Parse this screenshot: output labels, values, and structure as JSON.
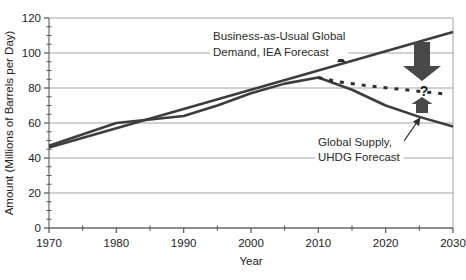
{
  "figure": {
    "background": "#ffffff"
  },
  "chart_data": {
    "type": "line",
    "title": "",
    "xlabel": "Year",
    "ylabel": "Amount (Millions of Barrels per Day)",
    "xlim": [
      1970,
      2030
    ],
    "ylim": [
      0,
      120
    ],
    "x_ticks": [
      1970,
      1980,
      1990,
      2000,
      2010,
      2020,
      2030
    ],
    "y_ticks": [
      0,
      20,
      40,
      60,
      80,
      100,
      120
    ],
    "x_minor_step": 5,
    "y_minor_step": 5,
    "grid": "horizontal",
    "legend_position": "none",
    "series": [
      {
        "name": "Business-as-Usual Global Demand, IEA Forecast",
        "x": [
          1970,
          2030
        ],
        "y": [
          46,
          112
        ],
        "style": "solid",
        "width": 2.4,
        "color": "#3d3d3d"
      },
      {
        "name": "Global Supply, UHDG Forecast",
        "x": [
          1970,
          1980,
          1990,
          1995,
          2000,
          2005,
          2010,
          2015,
          2020,
          2025,
          2030
        ],
        "y": [
          47,
          60,
          64,
          70,
          77,
          82.5,
          86,
          79,
          70,
          63.5,
          58
        ],
        "style": "solid",
        "width": 2.6,
        "color": "#3d3d3d"
      },
      {
        "name": "Reduced demand projection (unlabeled dashed)",
        "x": [
          2010,
          2013,
          2018,
          2024,
          2029
        ],
        "y": [
          86,
          83.5,
          81,
          78.5,
          76.5
        ],
        "style": "dashed",
        "width": 3,
        "color": "#2e2e2e"
      }
    ],
    "annotations": {
      "demand_label": {
        "lines": [
          "Business-as-Usual Global",
          "Demand, IEA Forecast"
        ],
        "x": 213,
        "y": 40,
        "line_height": 16
      },
      "supply_label": {
        "lines": [
          "Global Supply,",
          "UHDG Forecast"
        ],
        "x": 318,
        "y": 146,
        "line_height": 15
      },
      "question_mark": {
        "text": "?",
        "x": 424,
        "y": 96
      },
      "big_down_arrow": {
        "cx": 422,
        "top_y": 42,
        "head_top_y": 66,
        "tip_y": 81,
        "shaft_hw": 8,
        "head_hw": 19
      },
      "small_up_arrow": {
        "cx": 422,
        "bottom_y": 113,
        "head_base_y": 104,
        "tip_y": 97,
        "shaft_hw": 6,
        "head_hw": 10.5
      },
      "demand_leader": {
        "x1": 327,
        "y1": 52,
        "x2": 345,
        "y2": 62
      },
      "supply_leader": {
        "x1": 404,
        "y1": 141,
        "x2": 420,
        "y2": 118
      }
    },
    "colors": {
      "line": "#3d3d3d",
      "grid": "#9a9a9a",
      "axis": "#767676",
      "tick": "#555555",
      "text": "#222222",
      "arrow_fill": "#484848",
      "label_bg": "#ffffff"
    },
    "layout": {
      "plot_left": 49,
      "plot_right": 453,
      "plot_top": 18,
      "plot_bottom": 228
    }
  }
}
